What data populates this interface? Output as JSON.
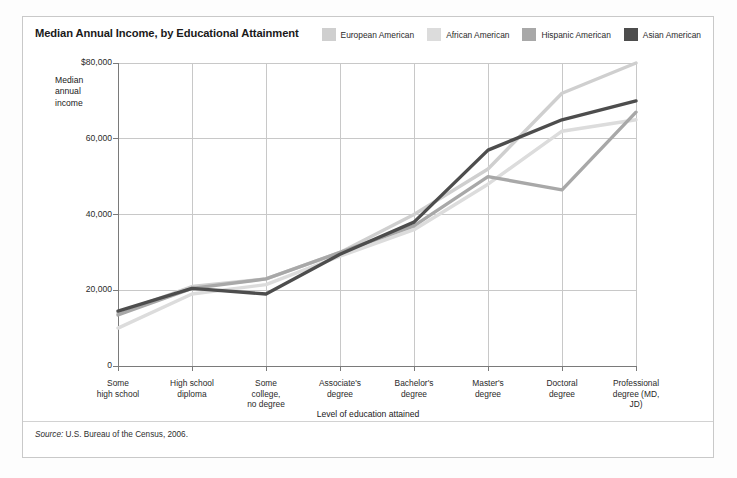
{
  "header": {
    "title": "Median Annual Income, by Educational Attainment"
  },
  "axes": {
    "y_caption": "Median annual income",
    "x_caption": "Level of education attained",
    "y_ticks": [
      "$80,000",
      "60,000",
      "40,000",
      "20,000",
      "0"
    ]
  },
  "source": {
    "label": "Source:",
    "text": " U.S. Bureau of the Census, 2006."
  },
  "colors": {
    "european": "#cfcfcf",
    "african": "#dcdcdc",
    "hispanic": "#a8a8a8",
    "asian": "#4d4d4d",
    "grid": "#c8c8c8",
    "axis": "#7a7a7a",
    "frame": "#c9c9c9"
  },
  "chart_data": {
    "type": "line",
    "title": "Median Annual Income, by Educational Attainment",
    "xlabel": "Level of education attained",
    "ylabel": "Median annual income",
    "ylim": [
      0,
      80000
    ],
    "ytick_values": [
      0,
      20000,
      40000,
      60000,
      80000
    ],
    "grid": true,
    "legend_position": "top-right",
    "categories": [
      "Some high school",
      "High school diploma",
      "Some college, no degree",
      "Associate's degree",
      "Bachelor's degree",
      "Master's degree",
      "Doctoral degree",
      "Professional degree (MD, JD)"
    ],
    "category_lines": [
      [
        "Some",
        "high school"
      ],
      [
        "High school",
        "diploma"
      ],
      [
        "Some",
        "college,",
        "no degree"
      ],
      [
        "Associate's",
        "degree"
      ],
      [
        "Bachelor's",
        "degree"
      ],
      [
        "Master's",
        "degree"
      ],
      [
        "Doctoral",
        "degree"
      ],
      [
        "Professional",
        "degree (MD,",
        "JD)"
      ]
    ],
    "series": [
      {
        "name": "European American",
        "color": "#cfcfcf",
        "values": [
          14000,
          21000,
          23000,
          30000,
          40000,
          52000,
          72000,
          80000
        ]
      },
      {
        "name": "African American",
        "color": "#dcdcdc",
        "values": [
          10000,
          19000,
          21500,
          29000,
          36000,
          48000,
          62000,
          65000
        ]
      },
      {
        "name": "Hispanic American",
        "color": "#a8a8a8",
        "values": [
          13500,
          20500,
          23000,
          30000,
          37000,
          50000,
          46500,
          67000
        ]
      },
      {
        "name": "Asian American",
        "color": "#4d4d4d",
        "values": [
          14500,
          20500,
          19000,
          29500,
          38000,
          57000,
          65000,
          70000
        ]
      }
    ]
  }
}
